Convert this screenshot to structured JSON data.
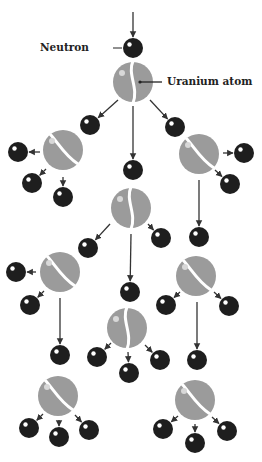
{
  "labels": {
    "neutron": "Neutron",
    "uranium": "Uranium atom"
  },
  "colors": {
    "neutron": "#1e1e1e",
    "uranium": "#9b9b9b",
    "arrow": "#333333",
    "highlight": "#ffffff"
  },
  "incoming_neutron": {
    "x": 133,
    "y": 48
  },
  "uranium_atoms": [
    {
      "id": "u0",
      "x": 133,
      "y": 82,
      "split": "vertical"
    },
    {
      "id": "u1",
      "x": 63,
      "y": 150,
      "split": "diagonal"
    },
    {
      "id": "u2",
      "x": 199,
      "y": 154,
      "split": "diagonal"
    },
    {
      "id": "u3",
      "x": 131,
      "y": 208,
      "split": "vertical"
    },
    {
      "id": "u4",
      "x": 60,
      "y": 272,
      "split": "diagonal"
    },
    {
      "id": "u5",
      "x": 196,
      "y": 276,
      "split": "diagonal"
    },
    {
      "id": "u6",
      "x": 127,
      "y": 328,
      "split": "vertical"
    },
    {
      "id": "u7",
      "x": 58,
      "y": 396,
      "split": "diagonal"
    },
    {
      "id": "u8",
      "x": 195,
      "y": 400,
      "split": "diagonal"
    }
  ],
  "neutrons": [
    {
      "x": 90,
      "y": 125,
      "from": [
        118,
        100
      ]
    },
    {
      "x": 133,
      "y": 170,
      "from": [
        133,
        106
      ]
    },
    {
      "x": 175,
      "y": 127,
      "from": [
        150,
        100
      ]
    },
    {
      "x": 18,
      "y": 152,
      "from": [
        40,
        152
      ]
    },
    {
      "x": 32,
      "y": 183,
      "from": [
        46,
        169
      ]
    },
    {
      "x": 63,
      "y": 197,
      "from": [
        63,
        177
      ]
    },
    {
      "x": 244,
      "y": 153,
      "from": [
        223,
        153
      ]
    },
    {
      "x": 230,
      "y": 184,
      "from": [
        215,
        170
      ]
    },
    {
      "x": 199,
      "y": 237,
      "from": [
        199,
        180
      ]
    },
    {
      "x": 88,
      "y": 248,
      "from": [
        110,
        224
      ]
    },
    {
      "x": 161,
      "y": 238,
      "from": [
        148,
        224
      ]
    },
    {
      "x": 130,
      "y": 292,
      "from": [
        131,
        234
      ]
    },
    {
      "x": 16,
      "y": 272,
      "from": [
        36,
        272
      ]
    },
    {
      "x": 30,
      "y": 305,
      "from": [
        44,
        291
      ]
    },
    {
      "x": 60,
      "y": 355,
      "from": [
        60,
        298
      ]
    },
    {
      "x": 166,
      "y": 305,
      "from": [
        180,
        292
      ]
    },
    {
      "x": 229,
      "y": 306,
      "from": [
        214,
        292
      ]
    },
    {
      "x": 197,
      "y": 360,
      "from": [
        197,
        302
      ]
    },
    {
      "x": 97,
      "y": 357,
      "from": [
        111,
        343
      ]
    },
    {
      "x": 129,
      "y": 373,
      "from": [
        128,
        352
      ]
    },
    {
      "x": 160,
      "y": 360,
      "from": [
        145,
        345
      ]
    },
    {
      "x": 29,
      "y": 428,
      "from": [
        43,
        414
      ]
    },
    {
      "x": 59,
      "y": 437,
      "from": [
        59,
        420
      ]
    },
    {
      "x": 89,
      "y": 430,
      "from": [
        75,
        415
      ]
    },
    {
      "x": 163,
      "y": 429,
      "from": [
        178,
        416
      ]
    },
    {
      "x": 195,
      "y": 443,
      "from": [
        195,
        424
      ]
    },
    {
      "x": 227,
      "y": 431,
      "from": [
        212,
        417
      ]
    }
  ]
}
